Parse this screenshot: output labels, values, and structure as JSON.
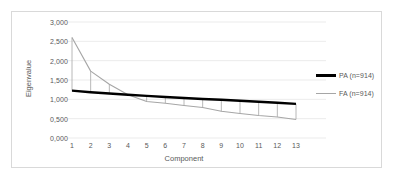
{
  "chart_data": {
    "type": "line",
    "title": "",
    "subtitle": "",
    "xlabel": "Component",
    "ylabel": "Eigenvalue",
    "x": [
      1,
      2,
      3,
      4,
      5,
      6,
      7,
      8,
      9,
      10,
      11,
      12,
      13
    ],
    "xticklabels": [
      "1",
      "2",
      "3",
      "4",
      "5",
      "6",
      "7",
      "8",
      "9",
      "10",
      "11",
      "12",
      "13"
    ],
    "yticks": [
      0,
      0.5,
      1.0,
      1.5,
      2.0,
      2.5,
      3.0
    ],
    "yticklabels": [
      "0,000",
      "0,500",
      "1,000",
      "1,500",
      "2,000",
      "2,500",
      "3,000"
    ],
    "ylim": [
      0,
      3.0
    ],
    "xlim": [
      1,
      13
    ],
    "grid": "horizontal",
    "legend_position": "right",
    "series": [
      {
        "name": "PA (n=914)",
        "color": "#000000",
        "linewidth": 2.4,
        "values": [
          1.225,
          1.185,
          1.15,
          1.118,
          1.09,
          1.062,
          1.035,
          1.01,
          0.988,
          0.963,
          0.938,
          0.912,
          0.882
        ]
      },
      {
        "name": "FA (n=914)",
        "color": "#a6a6a6",
        "linewidth": 1.1,
        "values": [
          2.6,
          1.73,
          1.39,
          1.12,
          0.945,
          0.9,
          0.84,
          0.79,
          0.69,
          0.635,
          0.58,
          0.545,
          0.48
        ]
      }
    ],
    "dropline_color": "#a6a6a6",
    "frame_border_color": "#d9d9d9",
    "gridline_color": "#e6e6e6",
    "background_color": "#ffffff"
  },
  "legend": {
    "items": [
      {
        "label": "PA (n=914)",
        "style": "pa"
      },
      {
        "label": "FA (n=914)",
        "style": "fa"
      }
    ]
  }
}
